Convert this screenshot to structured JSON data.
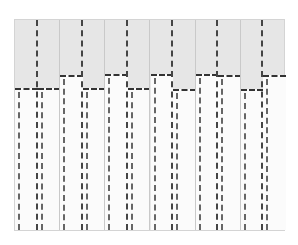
{
  "title": "",
  "colors": {
    "panel": "#e6e6e6",
    "fill": "#fbfbfb",
    "dash": "#333333",
    "separator": "#c9c9c9"
  },
  "panel": {
    "left": 14,
    "top": 19,
    "width": 271,
    "height": 212
  },
  "columns": [
    {
      "index": 1,
      "level": "low",
      "top": 87
    },
    {
      "index": 2,
      "level": "low",
      "top": 87
    },
    {
      "index": 3,
      "level": "high",
      "top": 74
    },
    {
      "index": 4,
      "level": "low",
      "top": 87
    },
    {
      "index": 5,
      "level": "high",
      "top": 73
    },
    {
      "index": 6,
      "level": "low",
      "top": 87
    },
    {
      "index": 7,
      "level": "high",
      "top": 73
    },
    {
      "index": 8,
      "level": "low",
      "top": 88
    },
    {
      "index": 9,
      "level": "high",
      "top": 73
    },
    {
      "index": 10,
      "level": "high",
      "top": 74
    },
    {
      "index": 11,
      "level": "low",
      "top": 88
    },
    {
      "index": 12,
      "level": "high",
      "top": 74
    }
  ]
}
